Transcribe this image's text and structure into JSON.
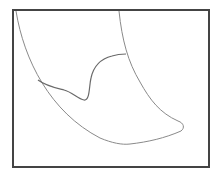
{
  "diagram": {
    "kind": "line-drawing",
    "frame": {
      "x": 12,
      "y": 9,
      "width": 196,
      "height": 157,
      "stroke": "#444444",
      "stroke_width": 2
    },
    "colors": {
      "background": "#ffffff",
      "outline_stroke": "#8a8a8a",
      "wavy_line_stroke": "#6a6a6a"
    },
    "paths": {
      "outer_left_curve": "M 16 11 C 24 60, 50 112, 100 138 C 112 143, 122 145, 130 144",
      "inner_right_curve": "M 119 11 C 122 40, 128 62, 140 82 C 150 100, 160 113, 178 121",
      "tip": "M 178 121 C 184 123, 185 128, 181 131",
      "bottom_edge": "M 181 131 C 165 138, 148 142, 130 144",
      "wavy_line": "M 38 80 C 46 86, 56 88, 64 90 C 72 92, 78 99, 84 100 C 90 101, 89 86, 91 78 C 94 64, 104 58, 112 56 C 118 54, 122 54, 126 54"
    }
  }
}
